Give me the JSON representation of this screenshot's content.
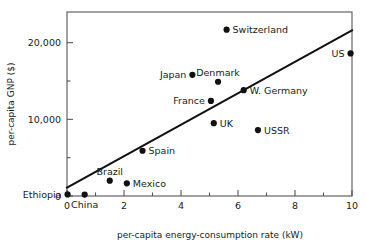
{
  "chart_data": {
    "type": "scatter",
    "title": "",
    "xlabel": "per-capita energy-consumption rate (kW)",
    "ylabel": "per-capita GNP ($)",
    "xlim": [
      0,
      10
    ],
    "ylim": [
      0,
      24000
    ],
    "xticks": [
      0,
      2,
      4,
      6,
      8,
      10
    ],
    "xticklabels": [
      "0",
      "2",
      "4",
      "6",
      "8",
      "10"
    ],
    "xminorticks": [
      1,
      3,
      5,
      7,
      9
    ],
    "yticks": [
      0,
      10000,
      20000
    ],
    "yticklabels": [
      "0",
      "10,000",
      "20,000"
    ],
    "yminorticks": [
      5000,
      15000
    ],
    "grid": false,
    "legend": null,
    "points": [
      {
        "name": "Ethiopia",
        "x": 0.02,
        "y": 200,
        "label_pos": "left"
      },
      {
        "name": "China",
        "x": 0.62,
        "y": 180,
        "label_pos": "below"
      },
      {
        "name": "Brazil",
        "x": 1.5,
        "y": 2000,
        "label_pos": "above"
      },
      {
        "name": "Mexico",
        "x": 2.1,
        "y": 1650,
        "label_pos": "right"
      },
      {
        "name": "Spain",
        "x": 2.65,
        "y": 5900,
        "label_pos": "right"
      },
      {
        "name": "Japan",
        "x": 4.4,
        "y": 15800,
        "label_pos": "left"
      },
      {
        "name": "Denmark",
        "x": 5.3,
        "y": 14900,
        "label_pos": "above"
      },
      {
        "name": "France",
        "x": 5.05,
        "y": 12400,
        "label_pos": "left"
      },
      {
        "name": "W. Germany",
        "x": 6.2,
        "y": 13800,
        "label_pos": "right"
      },
      {
        "name": "UK",
        "x": 5.15,
        "y": 9500,
        "label_pos": "right"
      },
      {
        "name": "USSR",
        "x": 6.7,
        "y": 8600,
        "label_pos": "right"
      },
      {
        "name": "Switzerland",
        "x": 5.6,
        "y": 21700,
        "label_pos": "right"
      },
      {
        "name": "US",
        "x": 9.95,
        "y": 18600,
        "label_pos": "left"
      }
    ],
    "trendline": {
      "name": "linear-fit",
      "x0": 0.0,
      "y0": 1100,
      "x1": 10.0,
      "y1": 21600
    },
    "colors": {
      "point": "#111111",
      "line": "#111111",
      "axis": "#555555",
      "text": "#1a1a1a",
      "background": "#ffffff"
    }
  }
}
